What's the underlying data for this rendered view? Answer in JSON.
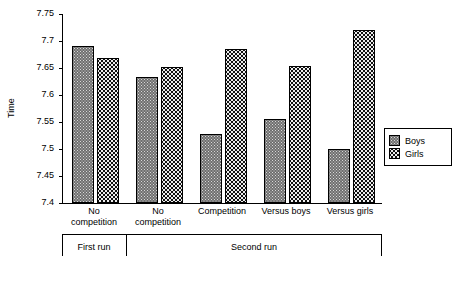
{
  "chart_data": {
    "type": "bar",
    "title": "",
    "xlabel": "",
    "ylabel": "Time",
    "ylim": [
      7.4,
      7.75
    ],
    "ytick_labels": [
      "7.4",
      "7.45",
      "7.5",
      "7.55",
      "7.6",
      "7.65",
      "7.7",
      "7.75"
    ],
    "ytick_values": [
      7.4,
      7.45,
      7.5,
      7.55,
      7.6,
      7.65,
      7.7,
      7.75
    ],
    "grid": false,
    "legend_position": "right",
    "categories": [
      "No competition",
      "No competition",
      "Competition",
      "Versus boys",
      "Versus girls"
    ],
    "category_lines": [
      [
        "No",
        "competition"
      ],
      [
        "No",
        "competition"
      ],
      [
        "Competition",
        ""
      ],
      [
        "Versus boys",
        ""
      ],
      [
        "Versus girls",
        ""
      ]
    ],
    "group_bands": [
      {
        "label": "First run",
        "categories": 1
      },
      {
        "label": "Second run",
        "categories": 4
      }
    ],
    "series": [
      {
        "name": "Boys",
        "color": "#6f6f6f",
        "values": [
          7.69,
          7.633,
          7.528,
          7.555,
          7.5
        ]
      },
      {
        "name": "Girls",
        "color": "#111111",
        "values": [
          7.668,
          7.652,
          7.686,
          7.653,
          7.72
        ]
      }
    ]
  }
}
